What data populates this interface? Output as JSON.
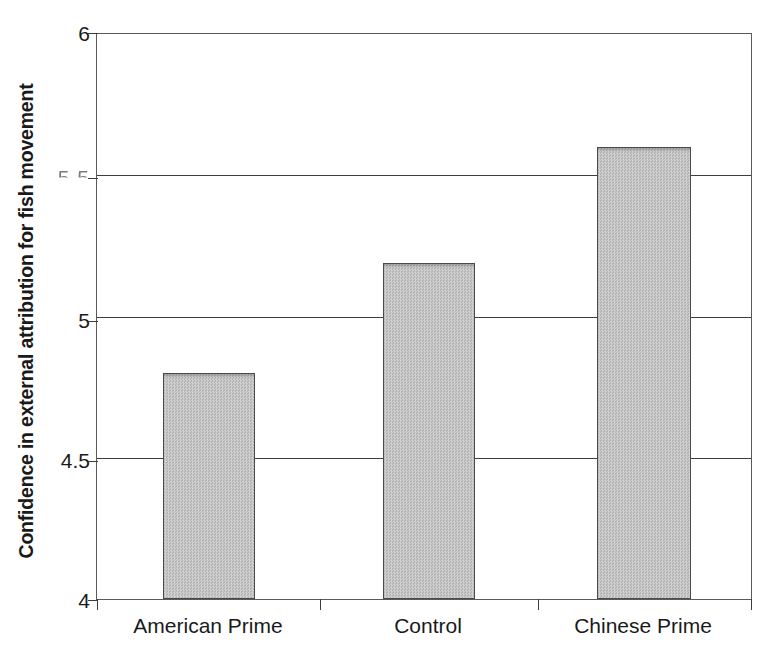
{
  "chart_data": {
    "type": "bar",
    "title": "",
    "subtitle": "",
    "xlabel": "",
    "ylabel": "Confidence in external attribution for fish movement",
    "categories": [
      "American Prime",
      "Control",
      "Chinese Prime"
    ],
    "values": [
      4.8,
      5.19,
      5.6
    ],
    "series": [
      {
        "name": "Confidence in external attribution",
        "values": [
          4.8,
          5.19,
          5.6
        ]
      }
    ],
    "ylim": [
      4,
      6
    ],
    "yticks": [
      4,
      4.5,
      5,
      5.5,
      6
    ],
    "ytick_labels": [
      "4",
      "4.5",
      "5",
      "5.5",
      "6"
    ],
    "grid": "horizontal",
    "gridlines_at": [
      4.5,
      5,
      5.5
    ],
    "legend": "none",
    "bar_fill_color": "#c2c2c2",
    "bar_edge_color": "#4a4a4a",
    "axis_color": "#3d3d3d"
  },
  "axis": {
    "y_title": "Confidence in external attribution for fish movement",
    "ticks": [
      {
        "label": "6",
        "value": 6,
        "degraded": false
      },
      {
        "label": "5.5",
        "value": 5.5,
        "degraded": true
      },
      {
        "label": "5",
        "value": 5,
        "degraded": false
      },
      {
        "label": "4.5",
        "value": 4.5,
        "degraded": false
      },
      {
        "label": "4",
        "value": 4,
        "degraded": false
      }
    ]
  },
  "bars": [
    {
      "label": "American Prime",
      "value": 4.8
    },
    {
      "label": "Control",
      "value": 5.19
    },
    {
      "label": "Chinese Prime",
      "value": 5.6
    }
  ]
}
